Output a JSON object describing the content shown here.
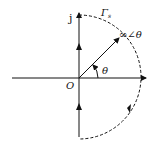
{
  "diagram": {
    "type": "nyquist-contour",
    "labels": {
      "imag_axis": "j",
      "contour": "Γ",
      "contour_sub": "s",
      "point": "∞∠θ",
      "angle": "θ",
      "origin": "O"
    },
    "colors": {
      "stroke": "#111111",
      "background": "#ffffff"
    }
  }
}
